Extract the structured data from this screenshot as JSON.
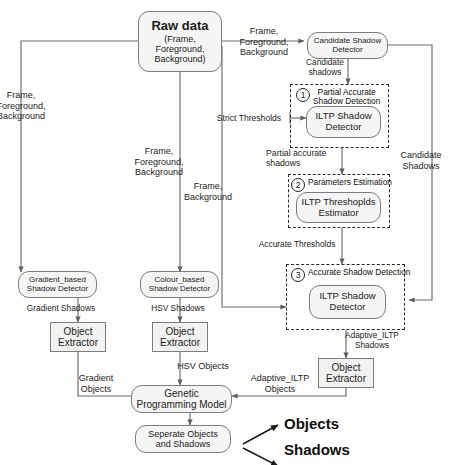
{
  "diagram": {
    "nodes": {
      "raw_data": {
        "l1": "Raw data",
        "l2": "(Frame,",
        "l3": "Foreground,",
        "l4": "Background)"
      },
      "candidate_shadow_detector": {
        "l1": "Candidate Shadow",
        "l2": "Detector"
      },
      "ilpt_shadow_detector_1": {
        "l1": "ILTP Shadow",
        "l2": "Detector"
      },
      "ilpt_thresholds_estimator": {
        "l1": "ILTP Threshoplds",
        "l2": "Estimator"
      },
      "ilpt_shadow_detector_3": {
        "l1": "ILTP Shadow",
        "l2": "Detector"
      },
      "gradient_based_detector": {
        "l1": "Gradient_based",
        "l2": "Shadow Detector"
      },
      "colour_based_detector": {
        "l1": "Colour_based",
        "l2": "Shadow Detector"
      },
      "object_extractor_gradient": {
        "l1": "Object",
        "l2": "Extractor"
      },
      "object_extractor_hsv": {
        "l1": "Object",
        "l2": "Extractor"
      },
      "object_extractor_ilpt": {
        "l1": "Object",
        "l2": "Extractor"
      },
      "genetic_programming_model": {
        "l1": "Genetic",
        "l2": "Programming Model"
      },
      "separate_objects_and_shadows": {
        "l1": "Seperate Objects",
        "l2": "and Shadows"
      }
    },
    "groups": [
      {
        "num": "1",
        "l1": "Partial Accurate",
        "l2": "Shadow Detection"
      },
      {
        "num": "2",
        "l1": "Parameters Estimation",
        "l2": ""
      },
      {
        "num": "3",
        "l1": "Accurate Shadow Detection",
        "l2": ""
      }
    ],
    "edge_labels": {
      "to_candidate": {
        "l1": "Frame,",
        "l2": "Foreground,",
        "l3": "Background"
      },
      "left_branch": {
        "l1": "Frame,",
        "l2": "Foreground,",
        "l3": "Background"
      },
      "mid_branch": {
        "l1": "Frame,",
        "l2": "Foreground,",
        "l3": "Background"
      },
      "frame_background": {
        "l1": "Frame,",
        "l2": "Background"
      },
      "candidate_shadows": {
        "l1": "Candidate",
        "l2": "shadows"
      },
      "strict_thresholds": {
        "l1": "Strict Thresholds"
      },
      "partial_accurate_shadows": {
        "l1": "Partial accurate",
        "l2": "shadows"
      },
      "candidate_shadows_right": {
        "l1": "Candidate",
        "l2": "Shadows"
      },
      "accurate_thresholds": {
        "l1": "Accurate Thresholds"
      },
      "gradient_shadows": {
        "l1": "Gradient Shadows"
      },
      "hsv_shadows": {
        "l1": "HSV Shadows"
      },
      "adaptive_ilpt_shadows": {
        "l1": "Adaptive_ILTP",
        "l2": "Shadows"
      },
      "gradient_objects": {
        "l1": "Gradient",
        "l2": "Objects"
      },
      "hsv_objects": {
        "l1": "HSV Objects"
      },
      "adaptive_ilpt_objects": {
        "l1": "Adaptive_ILTP",
        "l2": "Objects"
      }
    },
    "terminals": {
      "objects": "Objects",
      "shadows": "Shadows"
    },
    "colors": {
      "line": "#6e6e6e",
      "dashed": "#2a2a2a",
      "node_fill": "#f5f5f3",
      "node_stroke": "#7d7d7d",
      "text": "#1b1b1b"
    }
  }
}
